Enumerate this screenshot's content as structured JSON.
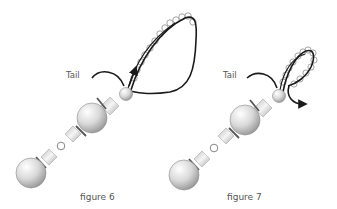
{
  "figures": [
    {
      "id": "figure-6",
      "caption": "figure 6",
      "tail_label": "Tail",
      "thread_direction": "up-into-loop",
      "loop_size": "large"
    },
    {
      "id": "figure-7",
      "caption": "figure 7",
      "tail_label": "Tail",
      "thread_direction": "out-down-right",
      "loop_size": "tight"
    }
  ],
  "colors": {
    "background": "#ffffff",
    "thread": "#1a1a1a",
    "bead_stroke": "#8a8a8a",
    "label_text": "#555555",
    "spacer_bar": "#555555"
  }
}
